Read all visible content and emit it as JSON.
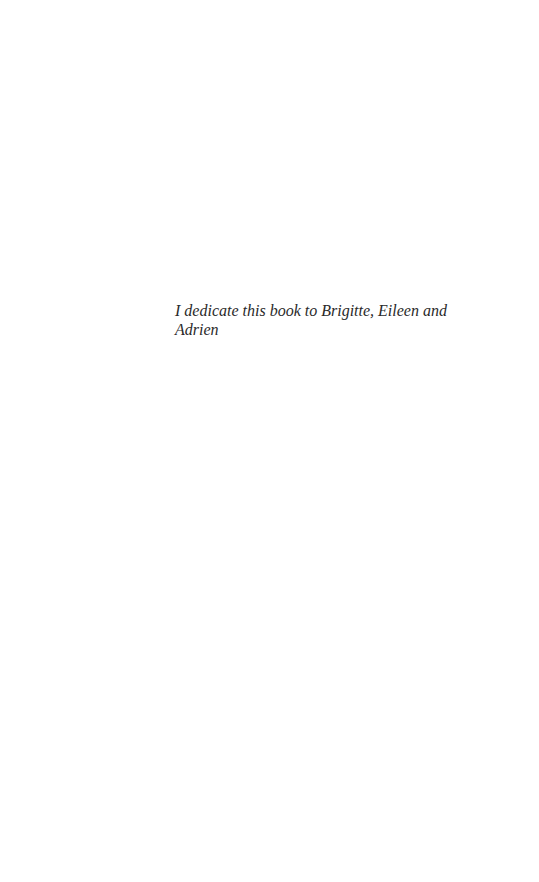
{
  "page": {
    "type": "dedication",
    "dedication_lines": [
      "I dedicate this book to Brigitte, Eileen and",
      "Adrien"
    ]
  }
}
